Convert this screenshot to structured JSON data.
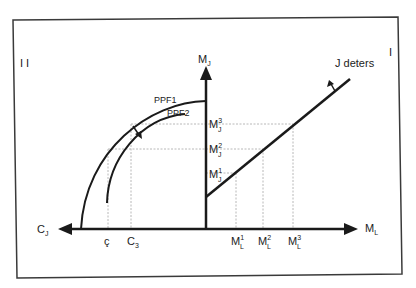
{
  "figure": {
    "quadrant_left": "I I",
    "quadrant_right": "I",
    "vertical_axis_label": "M",
    "vertical_axis_sub": "J",
    "horizontal_right_label": "M",
    "horizontal_right_sub": "L",
    "horizontal_left_label": "C",
    "horizontal_left_sub": "J",
    "curve_labels": {
      "ppf1": "PPF1",
      "ppf2": "PPF2",
      "line": "J  deters"
    },
    "y_ticks": [
      {
        "base": "M",
        "sub": "J",
        "sup": "3"
      },
      {
        "base": "M",
        "sub": "J",
        "sup": "2"
      },
      {
        "base": "M",
        "sub": "J",
        "sup": "1"
      }
    ],
    "x_ticks_right": [
      {
        "base": "M",
        "sub": "L",
        "sup": "1"
      },
      {
        "base": "M",
        "sub": "L",
        "sup": "2"
      },
      {
        "base": "M",
        "sub": "L",
        "sup": "3"
      }
    ],
    "x_ticks_left": [
      {
        "base": "ç",
        "sub": ""
      },
      {
        "base": "C",
        "sub": "3"
      }
    ],
    "colors": {
      "line": "#1a1a1a",
      "guide": "#b8b8b8",
      "frame": "#333333"
    }
  }
}
